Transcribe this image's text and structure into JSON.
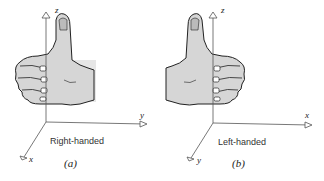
{
  "figure": {
    "panels": [
      {
        "id": "a",
        "sublabel": "(a)",
        "caption": "Right-handed",
        "axes": {
          "vertical": "z",
          "horizontal": "y",
          "diagonal": "x"
        },
        "hand": "right"
      },
      {
        "id": "b",
        "sublabel": "(b)",
        "caption": "Left-handed",
        "axes": {
          "vertical": "z",
          "horizontal": "x",
          "diagonal": "y"
        },
        "hand": "left"
      }
    ]
  },
  "colors": {
    "line": "#555555",
    "hand_fill": "#d9d9d9",
    "hand_outline": "#222222",
    "text": "#333333"
  }
}
